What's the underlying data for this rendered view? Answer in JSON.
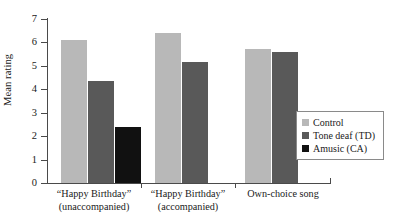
{
  "chart_data": {
    "type": "bar",
    "title": "",
    "xlabel": "",
    "ylabel": "Mean rating",
    "ylim": [
      0,
      7
    ],
    "yticks": [
      "0",
      "1",
      "2",
      "3",
      "4",
      "5",
      "6",
      "7"
    ],
    "grid": false,
    "legend_position": "right",
    "categories": [
      "“Happy Birthday” (unaccompanied)",
      "“Happy Birthday” (accompanied)",
      "Own-choice song"
    ],
    "category_lines": [
      [
        "“Happy Birthday”",
        "(unaccompanied)"
      ],
      [
        "“Happy Birthday”",
        "(accompanied)"
      ],
      [
        "Own-choice song"
      ]
    ],
    "series": [
      {
        "name": "Control",
        "color": "#b8b8b8",
        "values": [
          6.1,
          6.4,
          5.7
        ]
      },
      {
        "name": "Tone deaf (TD)",
        "color": "#595959",
        "values": [
          4.35,
          5.15,
          5.6
        ]
      },
      {
        "name": "Amusic (CA)",
        "color": "#111111",
        "values": [
          2.4,
          null,
          null
        ]
      }
    ]
  },
  "legend": {
    "items": [
      {
        "label": "Control",
        "color": "#b8b8b8",
        "swatch_name": "legend-swatch-control"
      },
      {
        "label": "Tone deaf (TD)",
        "color": "#595959",
        "swatch_name": "legend-swatch-tone-deaf"
      },
      {
        "label": "Amusic (CA)",
        "color": "#111111",
        "swatch_name": "legend-swatch-amusic"
      }
    ]
  },
  "axis": {
    "y_title": "Mean rating"
  }
}
